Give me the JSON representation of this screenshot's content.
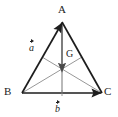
{
  "figure": {
    "background_color": "#ffffff",
    "stroke_dark": "#1d1d1d",
    "stroke_light": "#8c8c8c",
    "labels": {
      "vertex_a": "A",
      "vertex_b": "B",
      "vertex_c": "C",
      "centroid": "G",
      "vector_a": "a",
      "vector_b": "b"
    },
    "points": {
      "A": [
        62,
        22
      ],
      "B": [
        22,
        93
      ],
      "C": [
        102,
        93
      ],
      "G": [
        62,
        69
      ],
      "mid_AB": [
        42,
        57
      ],
      "mid_AC": [
        82,
        57
      ],
      "mid_BC": [
        62,
        93
      ]
    },
    "edges": [
      {
        "name": "vector-a-BA",
        "from": "B",
        "to": "A",
        "weight": "thick",
        "color": "#1d1d1d",
        "arrow": true
      },
      {
        "name": "vector-b-BC",
        "from": "B",
        "to": "C",
        "weight": "thick",
        "color": "#1d1d1d",
        "arrow": true
      },
      {
        "name": "side-AC",
        "from": "A",
        "to": "C",
        "weight": "thick",
        "color": "#1d1d1d",
        "arrow": false
      },
      {
        "name": "median-A-to-midBC",
        "from": "A",
        "to": "mid_BC",
        "weight": "thin",
        "color": "#8c8c8c",
        "arrow": true,
        "arrow_at": "G"
      },
      {
        "name": "median-B-to-midAC",
        "from": "B",
        "to": "mid_AC",
        "weight": "thin",
        "color": "#8c8c8c",
        "arrow": false
      },
      {
        "name": "median-C-to-midAB",
        "from": "C",
        "to": "mid_AB",
        "weight": "thin",
        "color": "#8c8c8c",
        "arrow": false
      }
    ],
    "tick_marks": [
      {
        "name": "midpoint-tick-BC",
        "at": [
          62,
          93
        ]
      }
    ]
  }
}
